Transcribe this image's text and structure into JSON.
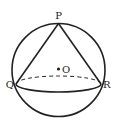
{
  "diagram": {
    "labels": {
      "apex": "P",
      "base_left": "Q",
      "base_right": "R",
      "center": "O"
    },
    "colors": {
      "stroke": "#222222",
      "background": "#ffffff"
    }
  }
}
